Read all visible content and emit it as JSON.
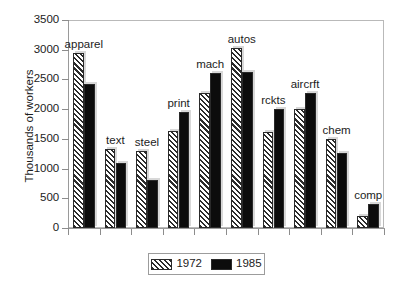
{
  "chart_data": {
    "type": "bar",
    "title": "",
    "subtitle": "",
    "xlabel": "",
    "ylabel": "Thousands of workers",
    "categories": [
      "apparel",
      "text",
      "steel",
      "print",
      "mach",
      "autos",
      "rckts",
      "aircrft",
      "chem",
      "comp"
    ],
    "series": [
      {
        "name": "1972",
        "pattern": "diagonal-hatch",
        "color": "#2b2b2b",
        "values": [
          2950,
          1330,
          1300,
          1630,
          2270,
          3030,
          1620,
          2010,
          1500,
          200
        ]
      },
      {
        "name": "1985",
        "pattern": "solid",
        "color": "#0c0c0c",
        "values": [
          2430,
          1100,
          810,
          1960,
          2600,
          2620,
          2010,
          2270,
          1260,
          410
        ]
      }
    ],
    "ylim": [
      0,
      3500
    ],
    "yticks": [
      0,
      500,
      1000,
      1500,
      2000,
      2500,
      3000,
      3500
    ],
    "ytick_labels": [
      "0",
      "500",
      "1000",
      "1500",
      "2000",
      "2500",
      "3000",
      "3500"
    ],
    "grid": false,
    "legend_position": "bottom-center",
    "legend_entries": [
      "1972",
      "1985"
    ]
  },
  "axis": {
    "y_title": "Thousands of workers"
  },
  "legend": {
    "entries": [
      {
        "label": "1972"
      },
      {
        "label": "1985"
      }
    ]
  }
}
